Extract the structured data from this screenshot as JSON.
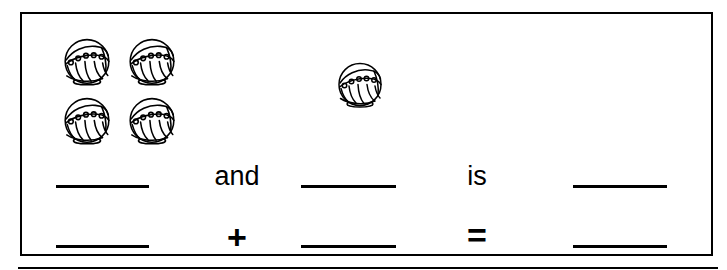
{
  "worksheet": {
    "type": "addition-picture-problem",
    "border_color": "#000000",
    "background_color": "#ffffff",
    "ink_color": "#000000"
  },
  "picture_groups": [
    {
      "name": "left-group",
      "icon": "decorated-ball-icon",
      "count": 4,
      "arrangement": "2x2-grid"
    },
    {
      "name": "right-group",
      "icon": "decorated-ball-icon",
      "count": 1,
      "arrangement": "single"
    }
  ],
  "sentence_row": {
    "blank_1": "",
    "word_and": "and",
    "blank_2": "",
    "word_is": "is",
    "blank_3": ""
  },
  "equation_row": {
    "blank_1": "",
    "symbol_plus": "+",
    "blank_2": "",
    "symbol_equals": "=",
    "blank_3": ""
  },
  "answer_key": {
    "addend_1": 4,
    "addend_2": 1,
    "sum": 5
  }
}
